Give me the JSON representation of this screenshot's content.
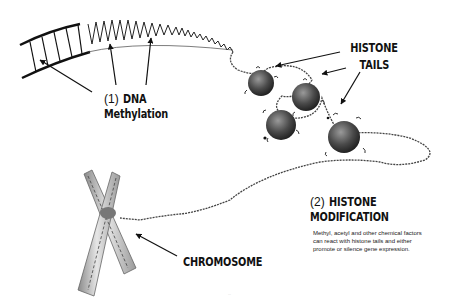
{
  "diagram": {
    "type": "illustration",
    "labels": {
      "dna_methylation": {
        "number": "(1)",
        "title_line1": "DNA",
        "title_line2": "Methylation"
      },
      "histone_tails": {
        "line1": "HISTONE",
        "line2": "TAILS"
      },
      "histone_modification": {
        "number": "(2)",
        "title_line1": "HISTONE",
        "title_line2": "MODIFICATION"
      },
      "histone_modification_description": "Methyl, acetyl and other chemical factors can react with histone tails and either promote or silence gene expression.",
      "chromosome": "CHROMOSOME",
      "credit": "···"
    },
    "elements": [
      {
        "name": "dna-double-helix",
        "description": "Large DNA ladder/helix arc across top-left, tapering into thin strand"
      },
      {
        "name": "methyl-groups",
        "description": "Small tags on DNA, pointed to by 3 arrows"
      },
      {
        "name": "nucleosomes",
        "count": 4,
        "description": "Dark spherical histone cores wrapped by DNA with small tails"
      },
      {
        "name": "chromatin-strand",
        "description": "Thin DNA strand looping right and back to chromosome"
      },
      {
        "name": "chromosome",
        "description": "X-shaped chromosome, bottom-left"
      }
    ],
    "arrows": [
      {
        "from": "dna_methylation",
        "to": "methyl-group-1"
      },
      {
        "from": "dna_methylation",
        "to": "methyl-group-2"
      },
      {
        "from": "dna_methylation",
        "to": "methyl-group-3"
      },
      {
        "from": "histone_tails",
        "to": "nucleosome-1"
      },
      {
        "from": "histone_tails",
        "to": "nucleosome-2"
      },
      {
        "from": "histone_tails",
        "to": "nucleosome-4"
      },
      {
        "from": "chromosome",
        "to": "chromosome-center"
      }
    ],
    "colors": {
      "ink": "#111111",
      "background": "#ffffff",
      "nucleosome": "#555555",
      "chromosome": "#b8b8b8"
    }
  }
}
